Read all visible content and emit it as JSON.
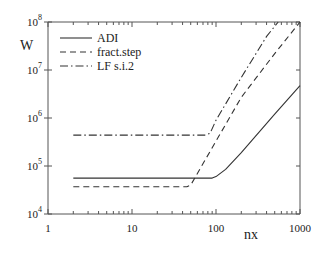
{
  "chart_data": {
    "type": "line",
    "title": "",
    "xlabel": "nx",
    "ylabel": "W",
    "xscale": "log",
    "yscale": "log",
    "xlim": [
      1,
      1000
    ],
    "ylim": [
      10000,
      100000000
    ],
    "x_ticks": [
      {
        "value": 1,
        "label": "1"
      },
      {
        "value": 10,
        "label": "10"
      },
      {
        "value": 100,
        "label": "100"
      },
      {
        "value": 1000,
        "label": "1000"
      }
    ],
    "y_ticks": [
      {
        "value": 10000,
        "base": "10",
        "exp": "4"
      },
      {
        "value": 100000,
        "base": "10",
        "exp": "5"
      },
      {
        "value": 1000000,
        "base": "10",
        "exp": "6"
      },
      {
        "value": 10000000,
        "base": "10",
        "exp": "7"
      },
      {
        "value": 100000000,
        "base": "10",
        "exp": "8"
      }
    ],
    "grid": false,
    "legend_position": "upper left",
    "series": [
      {
        "name": "ADI",
        "style": "solid",
        "x": [
          2,
          10,
          90,
          100,
          130,
          200,
          500,
          1000
        ],
        "y": [
          56000,
          56000,
          56000,
          60000,
          85000,
          190000,
          1200000,
          4700000
        ]
      },
      {
        "name": "fract.step",
        "style": "dashed",
        "x": [
          2,
          10,
          45,
          50,
          100,
          200,
          500,
          1000
        ],
        "y": [
          37000,
          37000,
          37000,
          40000,
          330000,
          2700000,
          22000000,
          100000000
        ]
      },
      {
        "name": "LF s.i.2",
        "style": "dashdot",
        "x": [
          2,
          10,
          75,
          85,
          100,
          200,
          400,
          550
        ],
        "y": [
          440000,
          440000,
          440000,
          480000,
          900000,
          7000000,
          50000000,
          100000000
        ]
      }
    ]
  }
}
